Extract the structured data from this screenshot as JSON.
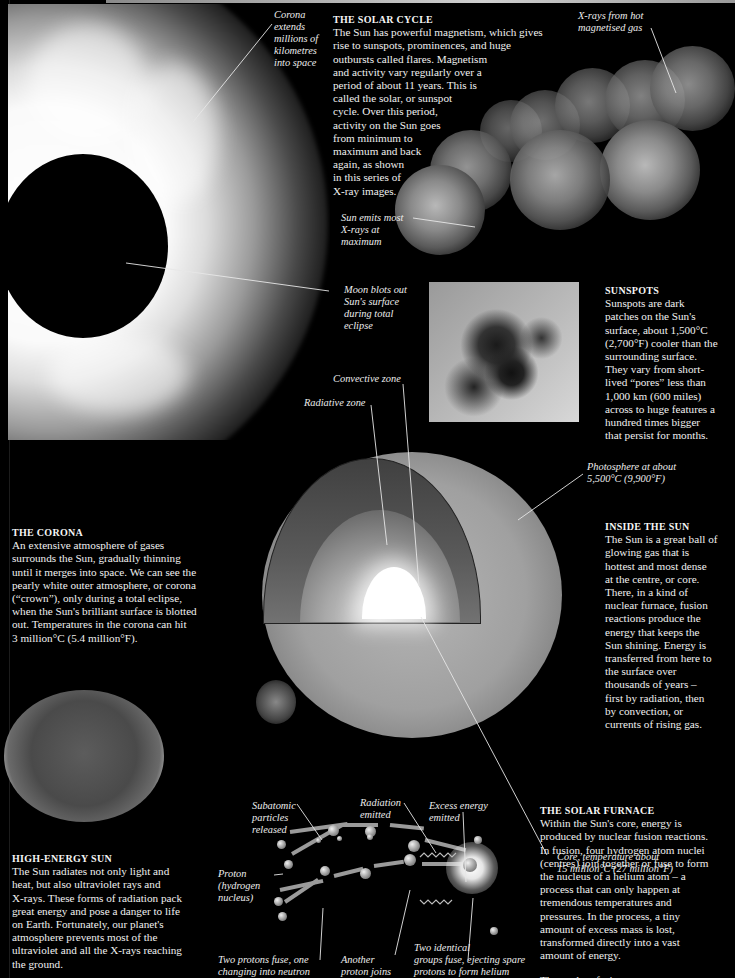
{
  "sections": {
    "solar_cycle": {
      "heading": "THE SOLAR CYCLE",
      "lines": [
        "The Sun has powerful magnetism, which gives",
        "rise to sunspots, prominences, and huge",
        "outbursts called flares. Magnetism",
        "and activity vary regularly over a",
        "period of about 11 years. This is",
        "called the solar, or sunspot",
        "cycle. Over this period,",
        "activity on the Sun goes",
        "from minimum to",
        "maximum and back",
        "again, as shown",
        "in this series of",
        "X-ray images."
      ]
    },
    "sunspots": {
      "heading": "SUNSPOTS",
      "lines": [
        "Sunspots are dark",
        "patches on the Sun's",
        "surface, about 1,500°C",
        "(2,700°F) cooler than the",
        "surrounding surface.",
        "They vary from short-",
        "lived “pores” less than",
        "1,000 km (600 miles)",
        "across to huge features a",
        "hundred times bigger",
        "that persist for months."
      ]
    },
    "corona": {
      "heading": "THE CORONA",
      "lines": [
        "An extensive atmosphere of gases",
        "surrounds the Sun, gradually thinning",
        "until it merges into space. We can see the",
        "pearly white outer atmosphere, or corona",
        "(“crown”), only during a total eclipse,",
        "when the Sun's brilliant surface is blotted",
        "out. Temperatures in the corona can hit",
        "3 million°C (5.4 million°F)."
      ]
    },
    "inside_sun": {
      "heading": "INSIDE THE SUN",
      "lines": [
        "The Sun is a great ball of",
        "glowing gas that is",
        "hottest and most dense",
        "at the centre, or core.",
        "There, in a kind of",
        "nuclear furnace, fusion",
        "reactions produce the",
        "energy that keeps the",
        "Sun shining. Energy is",
        "transferred from here to",
        "the surface over",
        "thousands of years –",
        "first by radiation, then",
        "by convection, or",
        "currents of rising gas."
      ]
    },
    "high_energy": {
      "heading": "HIGH-ENERGY SUN",
      "lines": [
        "The Sun radiates not only light and",
        "heat, but also ultraviolet rays and",
        "X-rays. These forms of radiation pack",
        "great energy and pose a danger to life",
        "on Earth. Fortunately, our planet's",
        "atmosphere prevents most of the",
        "ultraviolet and all the X-rays reaching",
        "the ground."
      ]
    },
    "solar_furnace": {
      "heading": "THE SOLAR FURNACE",
      "lines": [
        "Within the Sun's core, energy is",
        "produced by nuclear fusion reactions.",
        "In fusion, four hydrogen atom nuclei",
        "(centres) join together or fuse to form",
        "the nucleus of a helium atom – a",
        "process that can only happen at",
        "tremendous temperatures and",
        "pressures. In the process, a tiny",
        "amount of excess mass is lost,",
        "transformed directly into a vast",
        "amount of energy."
      ],
      "figure_caption": "The nuclear fusion process"
    }
  },
  "captions": {
    "corona_extends": [
      "Corona",
      "extends",
      "millions of",
      "kilometres",
      "into space"
    ],
    "xrays_hot_gas": [
      "X-rays from hot",
      "magnetised gas"
    ],
    "sun_emits_xrays": [
      "Sun emits most",
      "X-rays at",
      "maximum"
    ],
    "moon_blots": [
      "Moon blots out",
      "Sun's surface",
      "during total",
      "eclipse"
    ],
    "convective_zone": "Convective zone",
    "radiative_zone": "Radiative zone",
    "photosphere": [
      "Photosphere at about",
      "5,500°C (9,900°F)"
    ],
    "core_temp": [
      "Core, temperature about",
      "15 million°C (27 million°F)"
    ],
    "subatomic": [
      "Subatomic",
      "particles",
      "released"
    ],
    "radiation_emitted": [
      "Radiation",
      "emitted"
    ],
    "excess_energy": [
      "Excess energy",
      "emitted"
    ],
    "proton": [
      "Proton",
      "(hydrogen",
      "nucleus)"
    ],
    "two_protons": [
      "Two protons fuse, one",
      "changing into neutron"
    ],
    "another_proton": [
      "Another",
      "proton joins"
    ],
    "two_groups": [
      "Two identical",
      "groups fuse, ejecting spare",
      "protons to form helium"
    ]
  }
}
